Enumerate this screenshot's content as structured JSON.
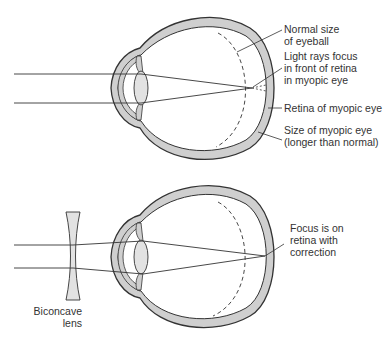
{
  "diagram": {
    "top_panel": {
      "name": "Myopic eye",
      "labels": [
        {
          "id": "normal-size",
          "text": "Normal size\nof eyeball"
        },
        {
          "id": "focus-front",
          "text": "Light rays focus\nin front of retina\nin myopic eye"
        },
        {
          "id": "retina-myopic",
          "text": "Retina of myopic eye"
        },
        {
          "id": "size-myopic",
          "text": "Size of myopic eye\n(longer than normal)"
        }
      ]
    },
    "bottom_panel": {
      "name": "Corrected myopic eye",
      "labels": [
        {
          "id": "focus-retina",
          "text": "Focus is on\nretina with\ncorrection"
        },
        {
          "id": "biconcave-lens",
          "text": "Biconcave\nlens"
        }
      ]
    },
    "colors": {
      "sclera_fill": "#cfcfcf",
      "outline": "#333333",
      "lens_fill": "#e2e2e2",
      "text": "#333333",
      "background": "#ffffff"
    }
  }
}
